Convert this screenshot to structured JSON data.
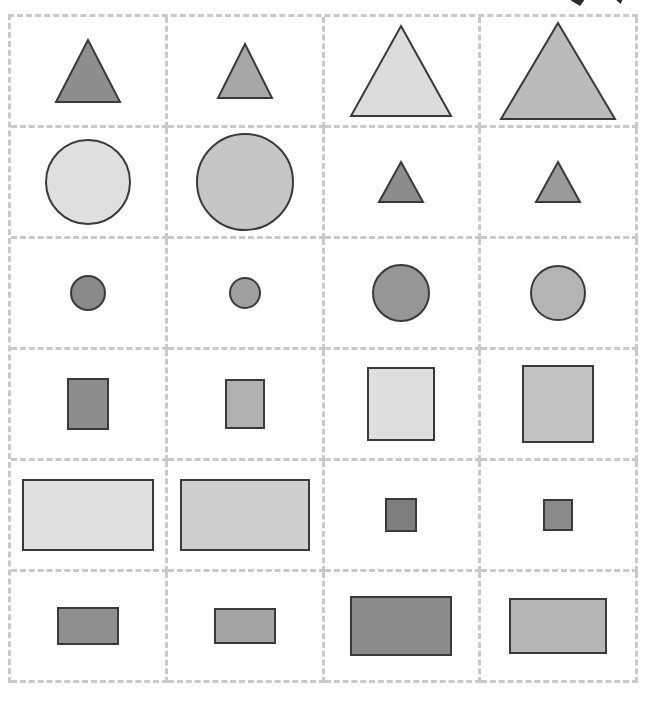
{
  "stimulus": {
    "title": "Grayscale shape grid stimulus",
    "canvas_width": 647,
    "canvas_height": 705,
    "background_color": "#ffffff",
    "grid": {
      "columns": 4,
      "rows": 6,
      "border_style": "dashed",
      "border_color": "#c9c9c9",
      "border_width_px": 3,
      "left_px": 8,
      "top_px": 14,
      "width_px": 630,
      "height_px": 669
    },
    "shape_outline_color": "#3a3a3a",
    "shape_outline_width_px": 2,
    "top_artifacts": [
      {
        "name": "cut-off-dark-mark-left",
        "left_px": 568,
        "top_px": -8
      },
      {
        "name": "cut-off-dark-mark-right",
        "left_px": 612,
        "top_px": -9
      }
    ],
    "cells": [
      {
        "row": 1,
        "col": 1,
        "shape": "triangle",
        "width_px": 64,
        "height_px": 62,
        "fill": "#8e8e8e",
        "stroke": "#3a3a3a",
        "label": "triangle-small-dark"
      },
      {
        "row": 1,
        "col": 2,
        "shape": "triangle",
        "width_px": 54,
        "height_px": 54,
        "fill": "#a8a8a8",
        "stroke": "#3a3a3a",
        "label": "triangle-small-mid"
      },
      {
        "row": 1,
        "col": 3,
        "shape": "triangle",
        "width_px": 100,
        "height_px": 90,
        "fill": "#dcdcdc",
        "stroke": "#3a3a3a",
        "label": "triangle-large-light"
      },
      {
        "row": 1,
        "col": 4,
        "shape": "triangle",
        "width_px": 114,
        "height_px": 96,
        "fill": "#bbbbbb",
        "stroke": "#3a3a3a",
        "label": "triangle-large-mid"
      },
      {
        "row": 2,
        "col": 1,
        "shape": "circle",
        "width_px": 84,
        "height_px": 84,
        "fill": "#dfdfdf",
        "stroke": "#3a3a3a",
        "label": "circle-large-light"
      },
      {
        "row": 2,
        "col": 2,
        "shape": "circle",
        "width_px": 96,
        "height_px": 96,
        "fill": "#c6c6c6",
        "stroke": "#3a3a3a",
        "label": "circle-large-mid"
      },
      {
        "row": 2,
        "col": 3,
        "shape": "triangle",
        "width_px": 44,
        "height_px": 40,
        "fill": "#8c8c8c",
        "stroke": "#3a3a3a",
        "label": "triangle-tiny-dark"
      },
      {
        "row": 2,
        "col": 4,
        "shape": "triangle",
        "width_px": 44,
        "height_px": 40,
        "fill": "#9a9a9a",
        "stroke": "#3a3a3a",
        "label": "triangle-tiny-mid"
      },
      {
        "row": 3,
        "col": 1,
        "shape": "circle",
        "width_px": 34,
        "height_px": 34,
        "fill": "#8a8a8a",
        "stroke": "#3a3a3a",
        "label": "circle-tiny-dark"
      },
      {
        "row": 3,
        "col": 2,
        "shape": "circle",
        "width_px": 30,
        "height_px": 30,
        "fill": "#a0a0a0",
        "stroke": "#3a3a3a",
        "label": "circle-tiny-mid"
      },
      {
        "row": 3,
        "col": 3,
        "shape": "circle",
        "width_px": 56,
        "height_px": 56,
        "fill": "#969696",
        "stroke": "#3a3a3a",
        "label": "circle-medium-dark"
      },
      {
        "row": 3,
        "col": 4,
        "shape": "circle",
        "width_px": 54,
        "height_px": 54,
        "fill": "#b4b4b4",
        "stroke": "#3a3a3a",
        "label": "circle-medium-mid"
      },
      {
        "row": 4,
        "col": 1,
        "shape": "rect",
        "width_px": 40,
        "height_px": 50,
        "fill": "#8d8d8d",
        "stroke": "#3a3a3a",
        "label": "square-small-dark"
      },
      {
        "row": 4,
        "col": 2,
        "shape": "rect",
        "width_px": 38,
        "height_px": 48,
        "fill": "#b0b0b0",
        "stroke": "#3a3a3a",
        "label": "square-small-mid"
      },
      {
        "row": 4,
        "col": 3,
        "shape": "rect",
        "width_px": 66,
        "height_px": 72,
        "fill": "#dedede",
        "stroke": "#3a3a3a",
        "label": "square-large-light"
      },
      {
        "row": 4,
        "col": 4,
        "shape": "rect",
        "width_px": 70,
        "height_px": 76,
        "fill": "#c3c3c3",
        "stroke": "#3a3a3a",
        "label": "square-large-mid"
      },
      {
        "row": 5,
        "col": 1,
        "shape": "rect",
        "width_px": 130,
        "height_px": 70,
        "fill": "#e0e0e0",
        "stroke": "#3a3a3a",
        "label": "rectangle-wide-light"
      },
      {
        "row": 5,
        "col": 2,
        "shape": "rect",
        "width_px": 128,
        "height_px": 70,
        "fill": "#cfcfcf",
        "stroke": "#3a3a3a",
        "label": "rectangle-wide-mid"
      },
      {
        "row": 5,
        "col": 3,
        "shape": "rect",
        "width_px": 30,
        "height_px": 32,
        "fill": "#7e7e7e",
        "stroke": "#3a3a3a",
        "label": "square-tiny-dark"
      },
      {
        "row": 5,
        "col": 4,
        "shape": "rect",
        "width_px": 28,
        "height_px": 30,
        "fill": "#8b8b8b",
        "stroke": "#3a3a3a",
        "label": "square-tiny-mid"
      },
      {
        "row": 6,
        "col": 1,
        "shape": "rect",
        "width_px": 60,
        "height_px": 36,
        "fill": "#8f8f8f",
        "stroke": "#3a3a3a",
        "label": "rectangle-small-dark"
      },
      {
        "row": 6,
        "col": 2,
        "shape": "rect",
        "width_px": 60,
        "height_px": 34,
        "fill": "#a3a3a3",
        "stroke": "#3a3a3a",
        "label": "rectangle-small-mid"
      },
      {
        "row": 6,
        "col": 3,
        "shape": "rect",
        "width_px": 100,
        "height_px": 58,
        "fill": "#8b8b8b",
        "stroke": "#3a3a3a",
        "label": "rectangle-large-dark"
      },
      {
        "row": 6,
        "col": 4,
        "shape": "rect",
        "width_px": 96,
        "height_px": 54,
        "fill": "#b6b6b6",
        "stroke": "#3a3a3a",
        "label": "rectangle-large-mid"
      }
    ]
  }
}
